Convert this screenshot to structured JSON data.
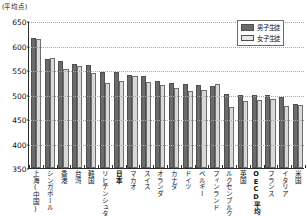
{
  "chart_data": {
    "type": "bar",
    "title": "",
    "xlabel": "",
    "ylabel": "(平均点)",
    "ylim": [
      350,
      650
    ],
    "yticks": [
      350,
      400,
      450,
      500,
      550,
      600,
      650
    ],
    "grid": true,
    "legend_position": "top-right",
    "categories": [
      "上海(中国)",
      "シンガポール",
      "香港",
      "台湾",
      "韓国",
      "リヒテンシュタイン",
      "日本",
      "マカオ",
      "スイス",
      "オランダ",
      "カナダ",
      "ドイツ",
      "ベルギー",
      "フィンランド",
      "ルクセンブルク",
      "英国",
      "OECD平均",
      "フランス",
      "イタリア",
      "米国"
    ],
    "highlighted_categories": [
      "日本",
      "OECD平均"
    ],
    "series": [
      {
        "name": "男子生徒",
        "color": "#6b6b6b",
        "values": [
          616,
          572,
          568,
          563,
          561,
          546,
          546,
          540,
          537,
          528,
          524,
          521,
          520,
          517,
          502,
          499,
          499,
          499,
          494,
          481
        ]
      },
      {
        "name": "女子生徒",
        "color": "#d9d9d9",
        "values": [
          613,
          575,
          553,
          558,
          544,
          524,
          527,
          538,
          525,
          519,
          513,
          507,
          509,
          521,
          475,
          487,
          489,
          491,
          476,
          479
        ]
      }
    ]
  },
  "legend": {
    "items": [
      {
        "label": "男子生徒",
        "key": "boys"
      },
      {
        "label": "女子生徒",
        "key": "girls"
      }
    ]
  }
}
